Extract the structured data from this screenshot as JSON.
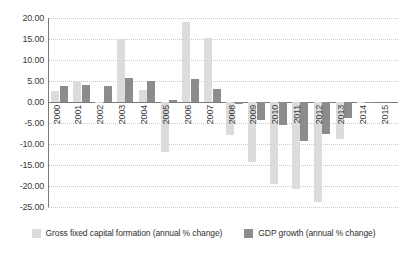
{
  "chart_data": {
    "type": "bar",
    "title": "",
    "subtitle": "",
    "xlabel": "",
    "ylabel": "",
    "grid": true,
    "legend_position": "bottom",
    "ylim": [
      -25,
      20
    ],
    "ytick_step": 5,
    "ytick_labels": [
      "20.00",
      "15.00",
      "10.00",
      "5.00",
      "0.00",
      "-5.00",
      "-10.00",
      "-15.00",
      "-20.00",
      "-25.00"
    ],
    "ytick_values": [
      20,
      15,
      10,
      5,
      0,
      -5,
      -10,
      -15,
      -20,
      -25
    ],
    "categories": [
      "2000",
      "2001",
      "2002",
      "2003",
      "2004",
      "2005",
      "2006",
      "2007",
      "2008",
      "2009",
      "2010",
      "2011",
      "2012",
      "2013",
      "2014",
      "2015"
    ],
    "series": [
      {
        "name": "Gross fixed capital formation (annual % change)",
        "color": "#dcdcdc",
        "values": [
          2.7,
          5.1,
          -0.1,
          14.9,
          2.8,
          -11.9,
          19.0,
          15.3,
          -7.8,
          -14.4,
          -19.6,
          -20.7,
          -23.8,
          -8.7,
          -0.3,
          0.0
        ]
      },
      {
        "name": "GDP growth (annual % change)",
        "color": "#8c8c8c",
        "values": [
          3.9,
          4.1,
          3.9,
          5.6,
          5.0,
          0.4,
          5.5,
          3.2,
          -0.4,
          -4.3,
          -5.5,
          -9.4,
          -7.5,
          -3.9,
          -0.2,
          0.0
        ]
      }
    ]
  },
  "legend": {
    "items": [
      {
        "label": "Gross fixed capital formation (annual % change)",
        "swatch": "light"
      },
      {
        "label": "GDP growth (annual % change)",
        "swatch": "dark"
      }
    ]
  }
}
